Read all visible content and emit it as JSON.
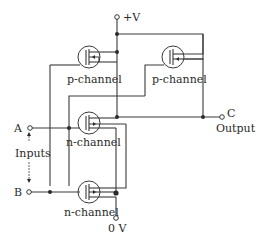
{
  "diagram": {
    "supply_label": "+V",
    "ground_label": "0 V",
    "output_terminal_label": "C",
    "output_label": "Output",
    "input_a_label": "A",
    "input_b_label": "B",
    "inputs_label": "Inputs",
    "transistors": [
      {
        "id": "p1",
        "label": "p-channel"
      },
      {
        "id": "p2",
        "label": "p-channel"
      },
      {
        "id": "n1",
        "label": "n-channel"
      },
      {
        "id": "n2",
        "label": "n-channel"
      }
    ]
  }
}
